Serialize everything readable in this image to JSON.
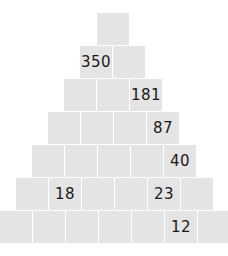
{
  "puzzle": {
    "type": "number-pyramid",
    "rows": [
      [
        "",
        ""
      ],
      [
        "350",
        ""
      ],
      [
        "",
        "",
        "181"
      ],
      [
        "",
        "",
        "",
        "87"
      ],
      [
        "",
        "",
        "",
        "",
        "40"
      ],
      [
        "",
        "18",
        "",
        "",
        "23",
        ""
      ],
      [
        "",
        "",
        "",
        "",
        "",
        "12",
        ""
      ]
    ]
  }
}
